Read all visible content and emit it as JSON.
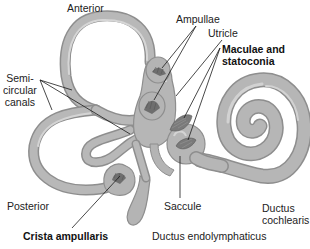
{
  "diagram": {
    "colors": {
      "tube_fill": "#b4b4b4",
      "tube_edge": "#8e8e8e",
      "tube_highlight": "#d2d2d2",
      "sensory_patch": "#6e6e6e",
      "leader_line": "#1a1a1a",
      "background": "#ffffff"
    },
    "labels": {
      "anterior": "Anterior",
      "ampullae": "Ampullae",
      "utricle": "Utricle",
      "maculae": "Maculae and\nstatoconia",
      "semicircular": "Semi-\ncircular\ncanals",
      "posterior": "Posterior",
      "crista": "Crista ampullaris",
      "saccule": "Saccule",
      "endolymphaticus": "Ductus endolymphaticus",
      "cochlearis": "Ductus\ncochlearis"
    }
  }
}
